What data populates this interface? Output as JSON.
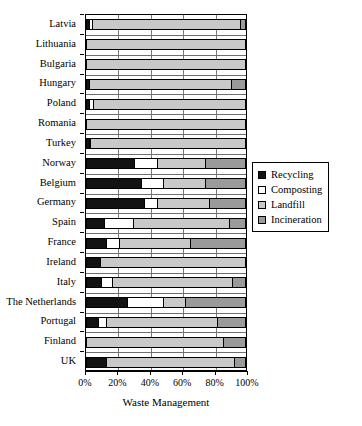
{
  "chart_data": {
    "type": "bar",
    "orientation": "horizontal",
    "stacked": true,
    "title": "",
    "xlabel": "Waste Management",
    "ylabel": "",
    "xlim": [
      0,
      100
    ],
    "xticks": [
      "0%",
      "20%",
      "40%",
      "60%",
      "80%",
      "100%"
    ],
    "xtick_values": [
      0,
      20,
      40,
      60,
      80,
      100
    ],
    "grid": "vertical",
    "legend_position": "right",
    "categories": [
      "Latvia",
      "Lithuania",
      "Bulgaria",
      "Hungary",
      "Poland",
      "Romania",
      "Turkey",
      "Norway",
      "Belgium",
      "Germany",
      "Spain",
      "France",
      "Ireland",
      "Italy",
      "The Netherlands",
      "Portugal",
      "Finland",
      "UK"
    ],
    "series": [
      {
        "name": "Recycling",
        "color": "#121212",
        "values": [
          1,
          0,
          0,
          1.5,
          1.5,
          0,
          1,
          30,
          34,
          36,
          11,
          12,
          8,
          9,
          25,
          7,
          0,
          12
        ]
      },
      {
        "name": "Composting",
        "color": "#ffffff",
        "values": [
          2,
          0,
          0,
          0,
          2,
          0,
          1,
          14,
          14,
          8,
          18,
          8,
          0,
          7,
          23,
          5,
          0,
          0
        ]
      },
      {
        "name": "Landfill",
        "color": "#c9c9c9",
        "values": [
          94,
          100,
          100,
          89.5,
          96.5,
          100,
          98,
          31,
          27,
          33,
          61,
          45,
          92,
          76,
          14,
          70,
          86,
          81
        ]
      },
      {
        "name": "Incineration",
        "color": "#9a9a9a",
        "values": [
          3,
          0,
          0,
          9,
          0,
          0,
          0,
          25,
          25,
          23,
          10,
          35,
          0,
          8,
          38,
          18,
          14,
          7
        ]
      }
    ],
    "legend_entries": [
      {
        "label": "Recycling",
        "color": "#121212"
      },
      {
        "label": "Composting",
        "color": "#ffffff"
      },
      {
        "label": "Landfill",
        "color": "#c9c9c9"
      },
      {
        "label": "Incineration",
        "color": "#9a9a9a"
      }
    ]
  }
}
